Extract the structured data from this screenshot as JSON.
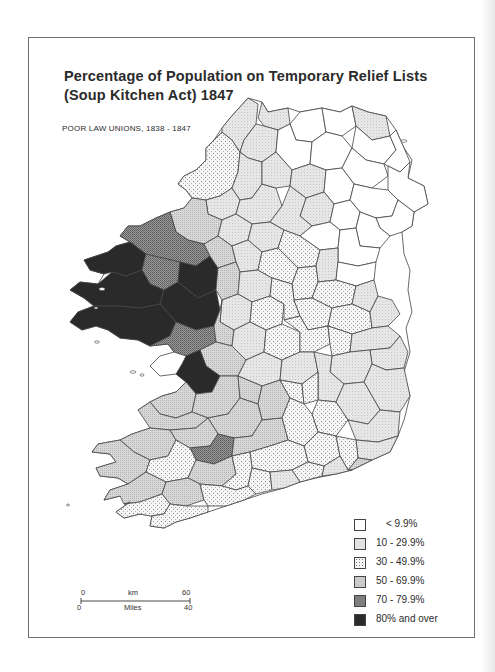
{
  "map": {
    "title_line1": "Percentage of Population on Temporary Relief Lists",
    "title_line2": "(Soup Kitchen Act) 1847",
    "subtitle": "POOR LAW UNIONS, 1838 - 1847",
    "region": "Ireland",
    "unit": "Poor Law Union"
  },
  "legend": {
    "items": [
      {
        "label": "< 9.9%",
        "fill": "#ffffff",
        "pattern": "none"
      },
      {
        "label": "10 - 29.9%",
        "fill": "#e4e4e4",
        "pattern": "fine-stipple"
      },
      {
        "label": "30 - 49.9%",
        "fill": "#f4f4f4",
        "pattern": "dots"
      },
      {
        "label": "50 - 69.9%",
        "fill": "#cfcfcf",
        "pattern": "crosshatch-light"
      },
      {
        "label": "70 - 79.9%",
        "fill": "#8a8a8a",
        "pattern": "crosshatch-dark"
      },
      {
        "label": "80% and over",
        "fill": "#2a2a2a",
        "pattern": "solid"
      }
    ]
  },
  "scale_bar": {
    "km_label": "km",
    "km_start": "0",
    "km_end": "60",
    "miles_label": "Miles",
    "miles_start": "0",
    "miles_end": "40"
  },
  "colors": {
    "frame_border": "#6f6f6f",
    "text": "#2b2b2b",
    "boundary": "#444444"
  }
}
